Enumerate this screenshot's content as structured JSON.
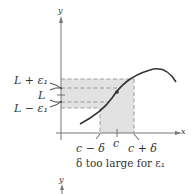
{
  "diagram": {
    "axes": {
      "x_label": "x",
      "y_label": "y"
    },
    "y_labels": {
      "upper": "L + ε₁",
      "mid": "L",
      "lower": "L − ε₁"
    },
    "x_labels": {
      "left": "c − δ",
      "mid": "c",
      "right": "c + δ"
    },
    "caption": "δ too large for ε₁",
    "next_axis_label": "y",
    "colors": {
      "shade": "#e2e2e2",
      "dash": "#8a8a8a",
      "curve": "#333333",
      "axis": "#777777"
    }
  }
}
